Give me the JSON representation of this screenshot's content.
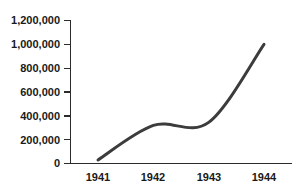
{
  "chart_data": {
    "type": "line",
    "title": "",
    "subtitle": "",
    "xlabel": "",
    "ylabel": "",
    "categories": [
      "1941",
      "1942",
      "1943",
      "1944"
    ],
    "x": [
      1941,
      1942,
      1943,
      1944
    ],
    "values": [
      30000,
      320000,
      345000,
      1000000
    ],
    "series": [
      {
        "name": "",
        "values": [
          30000,
          320000,
          345000,
          1000000
        ]
      }
    ],
    "ylim": [
      0,
      1200000
    ],
    "xlim": [
      1941,
      1944
    ],
    "y_ticks": [
      0,
      200000,
      400000,
      600000,
      800000,
      1000000,
      1200000
    ],
    "y_tick_labels": [
      "0",
      "200,000",
      "400,000",
      "600,000",
      "800,000",
      "1,000,000",
      "1,200,000"
    ],
    "x_ticks": [
      1941,
      1942,
      1943,
      1944
    ],
    "x_tick_labels": [
      "1941",
      "1942",
      "1943",
      "1944"
    ],
    "grid": false,
    "legend": false,
    "legend_position": "none",
    "smoothing": "spline",
    "line_color": "#3c3c3c",
    "axis_color": "#2b2b2b",
    "background_color": "#ffffff",
    "annotations": []
  },
  "axes": {
    "y_labels": {
      "t6": "1,200,000",
      "t5": "1,000,000",
      "t4": "800,000",
      "t3": "600,000",
      "t2": "400,000",
      "t1": "200,000",
      "t0": "0"
    },
    "x_labels": {
      "c0": "1941",
      "c1": "1942",
      "c2": "1943",
      "c3": "1944"
    }
  }
}
